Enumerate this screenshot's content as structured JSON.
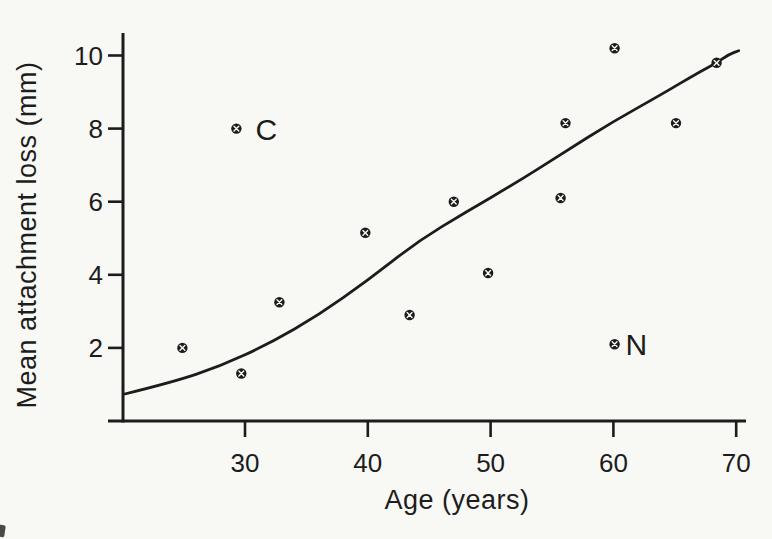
{
  "figure": {
    "background": "#f8f8f5",
    "ink": "#1c1c1c"
  },
  "chart_data": {
    "type": "scatter",
    "title": "",
    "xlabel": "Age (years)",
    "ylabel": "Mean attachment loss (mm)",
    "xlim": [
      20,
      71
    ],
    "ylim": [
      0,
      10.6
    ],
    "x_ticks": [
      30,
      40,
      50,
      60,
      70
    ],
    "y_ticks": [
      2,
      4,
      6,
      8,
      10
    ],
    "grid": false,
    "legend": false,
    "marker_style": "filled-circle-with-white-x",
    "points": [
      {
        "x": 24.9,
        "y": 2.0
      },
      {
        "x": 29.7,
        "y": 1.3
      },
      {
        "x": 29.3,
        "y": 8.0,
        "label": "C"
      },
      {
        "x": 32.8,
        "y": 3.25
      },
      {
        "x": 39.8,
        "y": 5.15
      },
      {
        "x": 43.4,
        "y": 2.9
      },
      {
        "x": 47.0,
        "y": 6.0
      },
      {
        "x": 49.8,
        "y": 4.05
      },
      {
        "x": 55.7,
        "y": 6.1
      },
      {
        "x": 56.1,
        "y": 8.15
      },
      {
        "x": 60.1,
        "y": 10.2
      },
      {
        "x": 60.1,
        "y": 2.1,
        "label": "N"
      },
      {
        "x": 65.1,
        "y": 8.15
      },
      {
        "x": 68.4,
        "y": 9.8
      }
    ],
    "trend_line": {
      "name": "smoothed trend curve",
      "points": [
        [
          20.2,
          0.74
        ],
        [
          24,
          1.05
        ],
        [
          28,
          1.5
        ],
        [
          32,
          2.12
        ],
        [
          36,
          2.9
        ],
        [
          40,
          3.85
        ],
        [
          44,
          4.9
        ],
        [
          48,
          5.72
        ],
        [
          52,
          6.5
        ],
        [
          56,
          7.35
        ],
        [
          60,
          8.2
        ],
        [
          64,
          8.95
        ],
        [
          67,
          9.55
        ],
        [
          68.4,
          9.8
        ],
        [
          69.4,
          10.03
        ],
        [
          70.2,
          10.13
        ]
      ]
    }
  }
}
